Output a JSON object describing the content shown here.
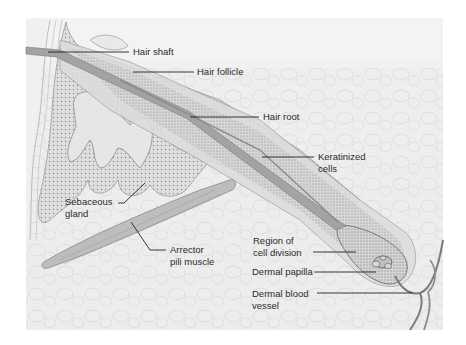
{
  "figure": {
    "type": "anatomical-illustration",
    "colors": {
      "background": "#ffffff",
      "tissue": "#ececec",
      "follicle": "#d9d9d9",
      "hair": "#9a9a9a",
      "muscle": "#b3b3b3",
      "vessel": "#7d7d7d",
      "leader_line": "#222222",
      "text": "#2a2a2a"
    }
  },
  "labels": {
    "hair_shaft": "Hair shaft",
    "hair_follicle": "Hair follicle",
    "hair_root": "Hair root",
    "keratinized_cells": {
      "line1": "Keratinized",
      "line2": "cells"
    },
    "sebaceous_gland": {
      "line1": "Sebaceous",
      "line2": "gland"
    },
    "arrector_pili": {
      "line1": "Arrector",
      "line2": "pili muscle"
    },
    "region_cell_division": {
      "line1": "Region of",
      "line2": "cell division"
    },
    "dermal_papilla": "Dermal papilla",
    "dermal_blood_vessel": {
      "line1": "Dermal blood",
      "line2": "vessel"
    }
  }
}
